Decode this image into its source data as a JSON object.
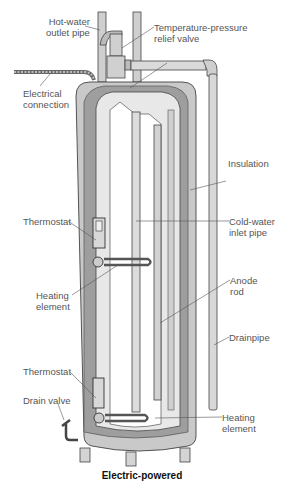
{
  "diagram": {
    "title": "Electric-powered",
    "labels": {
      "hot_water_outlet": [
        "Hot-water",
        "outlet pipe"
      ],
      "tp_relief_valve": [
        "Temperature-pressure",
        "relief valve"
      ],
      "electrical_connection": [
        "Electrical",
        "connection"
      ],
      "insulation": [
        "Insulation"
      ],
      "thermostat_upper": [
        "Thermostat"
      ],
      "cold_water_inlet": [
        "Cold-water",
        "inlet pipe"
      ],
      "heating_element_upper": [
        "Heating",
        "element"
      ],
      "anode_rod": [
        "Anode",
        "rod"
      ],
      "drainpipe": [
        "Drainpipe"
      ],
      "thermostat_lower": [
        "Thermostat"
      ],
      "drain_valve": [
        "Drain valve"
      ],
      "heating_element_lower": [
        "Heating",
        "element"
      ]
    },
    "colors": {
      "outer_shell": "#c9c9c9",
      "insulation": "#9a9a9a",
      "inner_tank": "#e6e6e6",
      "line": "#444444"
    }
  }
}
